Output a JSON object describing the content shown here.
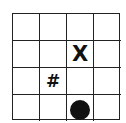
{
  "board": {
    "rows": 4,
    "cols": 4,
    "cells": [
      [
        "",
        "",
        "",
        ""
      ],
      [
        "",
        "",
        "X",
        ""
      ],
      [
        "",
        "#",
        "",
        ""
      ],
      [
        "",
        "",
        "circle",
        ""
      ]
    ]
  },
  "pieces": [
    {
      "type": "x-mark",
      "label": "X",
      "row": 1,
      "col": 2
    },
    {
      "type": "hash-mark",
      "label": "#",
      "row": 2,
      "col": 1
    },
    {
      "type": "circle",
      "label": "",
      "row": 3,
      "col": 2,
      "color": "#111111"
    }
  ]
}
